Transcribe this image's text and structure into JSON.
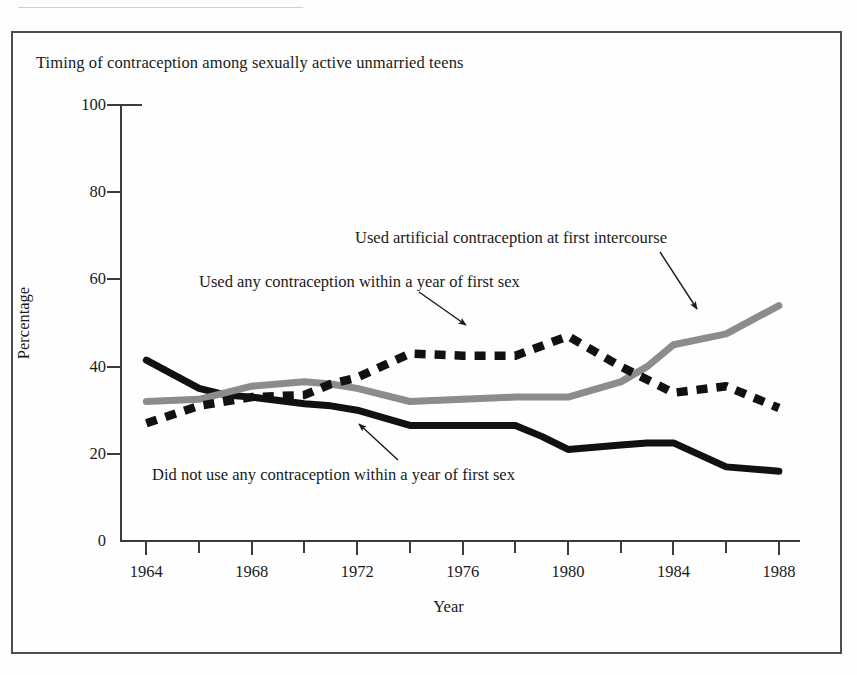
{
  "page": {
    "top_bleed_text": "———————————————————"
  },
  "chart_data": {
    "type": "line",
    "title": "Timing of contraception among sexually active unmarried teens",
    "xlabel": "Year",
    "ylabel": "Percentage",
    "xlim": [
      1963,
      1988.8
    ],
    "ylim": [
      0,
      100
    ],
    "grid": false,
    "legend_position": "inline-annotations",
    "ytick_labels": [
      "0",
      "20",
      "40",
      "60",
      "80",
      "100"
    ],
    "ytick_values": [
      0,
      20,
      40,
      60,
      80,
      100
    ],
    "xtick_labels": [
      "1964",
      "1968",
      "1972",
      "1976",
      "1980",
      "1984",
      "1988"
    ],
    "xtick_values": [
      1964,
      1968,
      1972,
      1976,
      1980,
      1984,
      1988
    ],
    "xtick_minor_values": [
      1966,
      1970,
      1974,
      1978,
      1982,
      1986
    ],
    "series": [
      {
        "name": "Did not use any contraception within a year of first sex",
        "style": "solid",
        "color": "#111111",
        "x": [
          1964,
          1966,
          1967,
          1968,
          1970,
          1971,
          1972,
          1974,
          1976,
          1978,
          1979,
          1980,
          1982,
          1983,
          1984,
          1986,
          1988
        ],
        "values": [
          41.5,
          35.0,
          33.5,
          33.0,
          31.5,
          31.0,
          30.0,
          26.5,
          26.5,
          26.5,
          24.0,
          21.0,
          22.0,
          22.5,
          22.5,
          17.0,
          16.0
        ]
      },
      {
        "name": "Used any contraception within a year of first sex",
        "style": "solid",
        "color": "#8c8c8c",
        "x": [
          1964,
          1966,
          1968,
          1970,
          1971,
          1972,
          1974,
          1976,
          1978,
          1980,
          1982,
          1983,
          1984,
          1986,
          1988
        ],
        "values": [
          32.0,
          32.5,
          35.5,
          36.5,
          36.0,
          35.0,
          32.0,
          32.5,
          33.0,
          33.0,
          36.5,
          40.0,
          45.0,
          47.5,
          54.0
        ]
      },
      {
        "name": "Used artificial contraception at first intercourse",
        "style": "dashed",
        "color": "#111111",
        "x": [
          1964,
          1966,
          1968,
          1970,
          1971,
          1972,
          1974,
          1976,
          1978,
          1980,
          1982,
          1984,
          1986,
          1988
        ],
        "values": [
          27.0,
          31.0,
          33.0,
          33.5,
          36.0,
          37.5,
          43.0,
          42.5,
          42.5,
          47.0,
          40.0,
          34.0,
          35.5,
          30.5
        ]
      }
    ],
    "annotations": [
      {
        "id": "artificial",
        "text": "Used artificial contraception at first intercourse",
        "points_to_series": "Used artificial contraception at first intercourse",
        "arrow_from": [
          660,
          252
        ],
        "arrow_to": [
          697,
          309
        ]
      },
      {
        "id": "anyuse",
        "text": "Used any contraception within a year of first sex",
        "points_to_series": "Used any contraception within a year of first sex",
        "arrow_from": [
          419,
          292
        ],
        "arrow_to": [
          466,
          325
        ]
      },
      {
        "id": "nouse",
        "text": "Did not use any contraception within a year of first sex",
        "points_to_series": "Did not use any contraception within a year of first sex",
        "arrow_from": [
          398,
          460
        ],
        "arrow_to": [
          359,
          424
        ]
      }
    ]
  }
}
